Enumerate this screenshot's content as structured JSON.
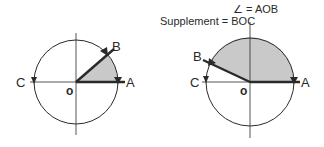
{
  "legend": {
    "angle_symbol": "∠",
    "angle_equals": "= AOB",
    "supplement_label": "Supplement",
    "supplement_equals": "= BOC"
  },
  "diagrams": [
    {
      "id": "acute",
      "labels": {
        "A": "A",
        "B": "B",
        "C": "C",
        "O": "o"
      },
      "description": "Acute angle AOB shaded; supplement BOC"
    },
    {
      "id": "obtuse",
      "labels": {
        "A": "A",
        "B": "B",
        "C": "C",
        "O": "o"
      },
      "description": "Obtuse angle AOB shaded; supplement BOC"
    }
  ],
  "colors": {
    "stroke": "#2a2a2a",
    "shade": "#c9c9c9",
    "background": "#ffffff"
  }
}
